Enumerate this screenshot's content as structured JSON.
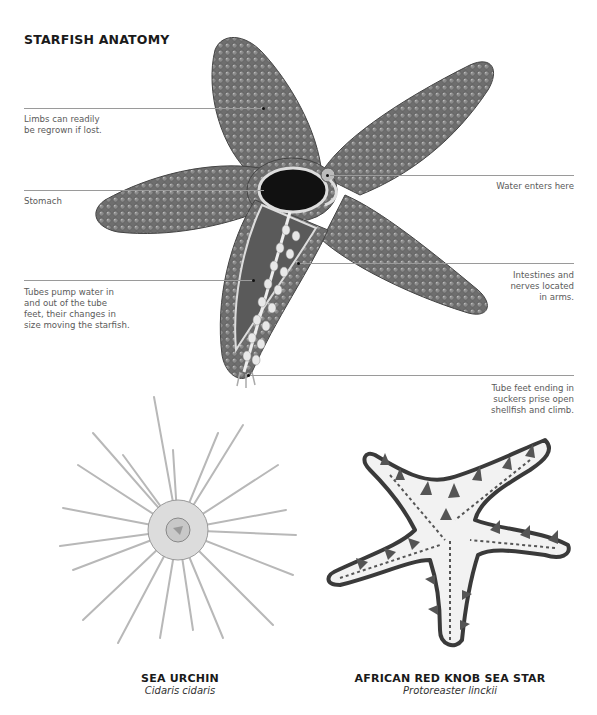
{
  "title": "STARFISH ANATOMY",
  "callouts": [
    {
      "id": "limbs",
      "text": [
        "Limbs can readily",
        "be regrown if lost."
      ],
      "side": "left"
    },
    {
      "id": "stomach",
      "text": [
        "Stomach"
      ],
      "side": "left"
    },
    {
      "id": "tubes",
      "text": [
        "Tubes pump water in",
        "and out of the tube",
        "feet, their changes in",
        "size moving the starfish."
      ],
      "side": "left"
    },
    {
      "id": "water",
      "text": [
        "Water enters here"
      ],
      "side": "right"
    },
    {
      "id": "intestines",
      "text": [
        "Intestines and",
        "nerves located",
        "in arms."
      ],
      "side": "right"
    },
    {
      "id": "tubefeet",
      "text": [
        "Tube feet ending in",
        "suckers prise open",
        "shellfish and climb."
      ],
      "side": "right"
    }
  ],
  "specimens": [
    {
      "common": "SEA URCHIN",
      "latin": "Cidaris cidaris"
    },
    {
      "common": "AFRICAN RED KNOB SEA STAR",
      "latin": "Protoreaster linckii"
    }
  ],
  "colors": {
    "leader": "#9a9a9a",
    "text": "#5a5a5a",
    "title": "#1a1a1a",
    "starfish_body": "#6f6f6f",
    "knob_star_body": "#f2f2f2",
    "knob_star_outline": "#3a3a3a"
  }
}
